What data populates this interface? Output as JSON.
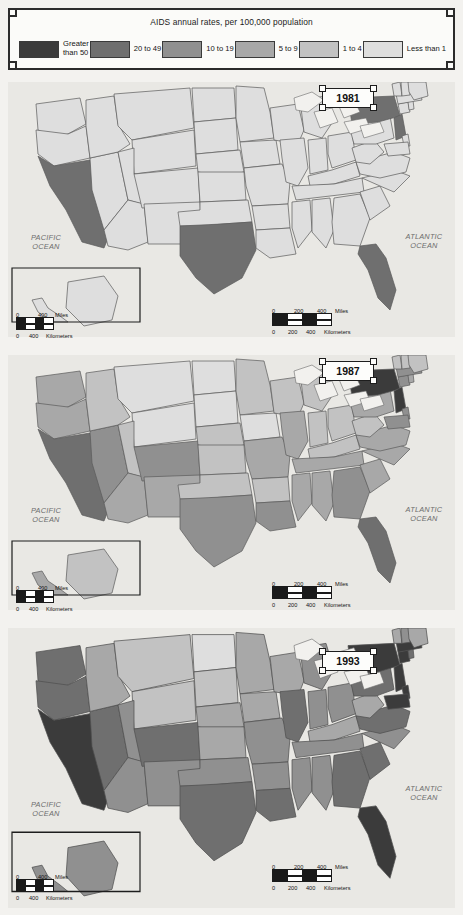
{
  "legend": {
    "title": "AIDS annual rates, per 100,000 population",
    "classes": [
      {
        "label": "Greater\nthan 50",
        "color": "#3b3b3b",
        "name": "greater-than-50"
      },
      {
        "label": "20 to 49",
        "color": "#6f6f6f",
        "name": "20-to-49"
      },
      {
        "label": "10 to 19",
        "color": "#909090",
        "name": "10-to-19"
      },
      {
        "label": "5 to 9",
        "color": "#a8a8a8",
        "name": "5-to-9"
      },
      {
        "label": "1 to 4",
        "color": "#c2c2c2",
        "name": "1-to-4"
      },
      {
        "label": "Less than 1",
        "color": "#dedede",
        "name": "less-than-1"
      }
    ]
  },
  "maps": [
    {
      "year": "1981",
      "pacific_ocean": "PACIFIC\nOCEAN",
      "atlantic_ocean": "ATLANTIC\nOCEAN",
      "scale_small": {
        "miles_zero": "0",
        "miles_max": "400",
        "miles_unit": "Miles",
        "km_zero": "0",
        "km_max": "400",
        "km_unit": "Kilometers"
      },
      "scale_large": {
        "miles_zero": "0",
        "miles_mid": "200",
        "miles_max": "400",
        "miles_unit": "Miles",
        "km_zero": "0",
        "km_mid": "200",
        "km_max": "400",
        "km_unit": "Kilometers"
      }
    },
    {
      "year": "1987",
      "pacific_ocean": "PACIFIC\nOCEAN",
      "atlantic_ocean": "ATLANTIC\nOCEAN",
      "scale_small": {
        "miles_zero": "0",
        "miles_max": "400",
        "miles_unit": "Miles",
        "km_zero": "0",
        "km_max": "400",
        "km_unit": "Kilometers"
      },
      "scale_large": {
        "miles_zero": "0",
        "miles_mid": "200",
        "miles_max": "400",
        "miles_unit": "Miles",
        "km_zero": "0",
        "km_mid": "200",
        "km_max": "400",
        "km_unit": "Kilometers"
      }
    },
    {
      "year": "1993",
      "pacific_ocean": "PACIFIC\nOCEAN",
      "atlantic_ocean": "ATLANTIC\nOCEAN",
      "scale_small": {
        "miles_zero": "0",
        "miles_max": "400",
        "miles_unit": "Miles",
        "km_zero": "0",
        "km_max": "400",
        "km_unit": "Kilometers"
      },
      "scale_large": {
        "miles_zero": "0",
        "miles_mid": "200",
        "miles_max": "400",
        "miles_unit": "Miles",
        "km_zero": "0",
        "km_mid": "200",
        "km_max": "400",
        "km_unit": "Kilometers"
      }
    }
  ],
  "chart_data": {
    "type": "choropleth-map-series",
    "title": "AIDS annual rates, per 100,000 population",
    "panels": [
      "1981",
      "1987",
      "1993"
    ],
    "class_breaks": [
      "Greater than 50",
      "20 to 49",
      "10 to 19",
      "5 to 9",
      "1 to 4",
      "Less than 1"
    ],
    "class_colors": [
      "#3b3b3b",
      "#6f6f6f",
      "#909090",
      "#a8a8a8",
      "#c2c2c2",
      "#dedede"
    ],
    "series": [
      {
        "name": "1981",
        "values": {
          "CA": "20 to 49",
          "NY": "20 to 49",
          "FL": "20 to 49",
          "TX": "20 to 49",
          "WA": "Less than 1",
          "OR": "Less than 1",
          "ID": "Less than 1",
          "NV": "Less than 1",
          "UT": "Less than 1",
          "AZ": "Less than 1",
          "MT": "Less than 1",
          "WY": "Less than 1",
          "CO": "Less than 1",
          "NM": "Less than 1",
          "ND": "Less than 1",
          "SD": "Less than 1",
          "NE": "Less than 1",
          "KS": "Less than 1",
          "OK": "Less than 1",
          "MN": "Less than 1",
          "IA": "Less than 1",
          "MO": "Less than 1",
          "AR": "Less than 1",
          "LA": "Less than 1",
          "WI": "Less than 1",
          "IL": "Less than 1",
          "MI": "Less than 1",
          "IN": "Less than 1",
          "OH": "Less than 1",
          "KY": "Less than 1",
          "TN": "Less than 1",
          "MS": "Less than 1",
          "AL": "Less than 1",
          "GA": "Less than 1",
          "SC": "Less than 1",
          "NC": "Less than 1",
          "VA": "Less than 1",
          "WV": "Less than 1",
          "PA": "Less than 1",
          "MD": "Less than 1",
          "DE": "Less than 1",
          "NJ": "20 to 49",
          "CT": "Less than 1",
          "RI": "Less than 1",
          "MA": "Less than 1",
          "VT": "Less than 1",
          "NH": "Less than 1",
          "ME": "Less than 1",
          "AK": "Less than 1",
          "HI": "Less than 1"
        }
      },
      {
        "name": "1987",
        "values": {
          "NY": "Greater than 50",
          "NJ": "Greater than 50",
          "CA": "20 to 49",
          "FL": "20 to 49",
          "TX": "10 to 19",
          "WA": "5 to 9",
          "OR": "5 to 9",
          "NV": "10 to 19",
          "AZ": "5 to 9",
          "CO": "10 to 19",
          "NM": "5 to 9",
          "GA": "10 to 19",
          "MD": "10 to 19",
          "LA": "10 to 19",
          "MA": "10 to 19",
          "CT": "10 to 19",
          "PA": "5 to 9",
          "IL": "5 to 9",
          "OH": "1 to 4",
          "MI": "1 to 4",
          "MO": "5 to 9",
          "ID": "1 to 4",
          "MT": "Less than 1",
          "WY": "Less than 1",
          "UT": "1 to 4",
          "ND": "Less than 1",
          "SD": "Less than 1",
          "NE": "1 to 4",
          "KS": "1 to 4",
          "OK": "1 to 4",
          "MN": "1 to 4",
          "IA": "Less than 1",
          "WI": "1 to 4",
          "IN": "1 to 4",
          "KY": "1 to 4",
          "TN": "5 to 9",
          "MS": "5 to 9",
          "AL": "5 to 9",
          "SC": "5 to 9",
          "NC": "5 to 9",
          "VA": "5 to 9",
          "WV": "1 to 4",
          "AR": "1 to 4",
          "DE": "10 to 19",
          "RI": "5 to 9",
          "VT": "1 to 4",
          "NH": "1 to 4",
          "ME": "1 to 4",
          "AK": "1 to 4",
          "HI": "5 to 9"
        }
      },
      {
        "name": "1993",
        "values": {
          "CA": "Greater than 50",
          "NY": "Greater than 50",
          "NJ": "Greater than 50",
          "FL": "Greater than 50",
          "MD": "Greater than 50",
          "CT": "Greater than 50",
          "MA": "Greater than 50",
          "DE": "Greater than 50",
          "TX": "20 to 49",
          "PA": "20 to 49",
          "GA": "20 to 49",
          "LA": "20 to 49",
          "NV": "20 to 49",
          "WA": "20 to 49",
          "IL": "20 to 49",
          "SC": "20 to 49",
          "AZ": "10 to 19",
          "OR": "20 to 49",
          "CO": "20 to 49",
          "NM": "10 to 19",
          "MO": "10 to 19",
          "TN": "10 to 19",
          "AL": "10 to 19",
          "MS": "10 to 19",
          "NC": "10 to 19",
          "VA": "20 to 49",
          "OH": "10 to 19",
          "MI": "10 to 19",
          "IN": "10 to 19",
          "RI": "20 to 49",
          "OK": "10 to 19",
          "AR": "10 to 19",
          "KY": "5 to 9",
          "WV": "5 to 9",
          "MN": "5 to 9",
          "WI": "5 to 9",
          "IA": "5 to 9",
          "KS": "5 to 9",
          "NE": "5 to 9",
          "UT": "10 to 19",
          "ID": "5 to 9",
          "MT": "1 to 4",
          "WY": "1 to 4",
          "ND": "Less than 1",
          "SD": "1 to 4",
          "NH": "10 to 19",
          "VT": "5 to 9",
          "ME": "5 to 9",
          "AK": "10 to 19",
          "HI": "10 to 19"
        }
      }
    ]
  }
}
